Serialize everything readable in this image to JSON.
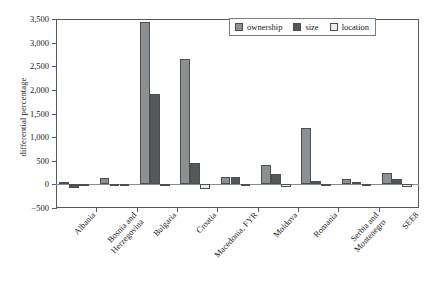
{
  "chart_data": {
    "type": "bar",
    "title": "",
    "xlabel": "",
    "ylabel": "differential percentage",
    "ylim": [
      -500,
      3500
    ],
    "ytick_values": [
      -500,
      0,
      500,
      1000,
      1500,
      2000,
      2500,
      3000,
      3500
    ],
    "ytick_labels": [
      "−500",
      "0",
      "500",
      "1,000",
      "1,500",
      "2,000",
      "2,500",
      "3,000",
      "3,500"
    ],
    "grid": false,
    "legend_position": "top-right",
    "categories": [
      "Albania",
      "Bosnia and Herzegovina",
      "Bulgaria",
      "Croatia",
      "Macedonia, FYR",
      "Moldova",
      "Romania",
      "Serbia and Montenegro",
      "SEE8"
    ],
    "category_lines": [
      [
        "Albania"
      ],
      [
        "Bosnia and",
        "Herzegovina"
      ],
      [
        "Bulgaria"
      ],
      [
        "Croatia"
      ],
      [
        "Macedonia, FYR"
      ],
      [
        "Moldova"
      ],
      [
        "Romania"
      ],
      [
        "Serbia and",
        "Montenegro"
      ],
      [
        "SEE8"
      ]
    ],
    "series": [
      {
        "name": "ownership",
        "color": "#8d9093",
        "values": [
          40,
          130,
          3430,
          2650,
          160,
          400,
          1190,
          110,
          250
        ]
      },
      {
        "name": "size",
        "color": "#55585b",
        "values": [
          -70,
          -40,
          1920,
          460,
          155,
          230,
          70,
          60,
          110
        ]
      },
      {
        "name": "location",
        "color": "#ececec",
        "values": [
          -15,
          -25,
          -40,
          -100,
          -10,
          -60,
          -10,
          -30,
          -60
        ]
      }
    ]
  },
  "legend": {
    "items": [
      {
        "label": "ownership"
      },
      {
        "label": "size"
      },
      {
        "label": "location"
      }
    ]
  }
}
